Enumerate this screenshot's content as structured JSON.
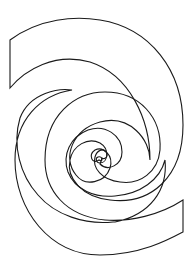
{
  "figure": {
    "bands": [
      {
        "name": "horizontal-hatched-band",
        "hatch": "horizontal"
      },
      {
        "name": "vertical-hatched-band",
        "hatch": "vertical"
      }
    ],
    "colors": {
      "ink": "#1a1a1a",
      "background": "#ffffff"
    }
  }
}
